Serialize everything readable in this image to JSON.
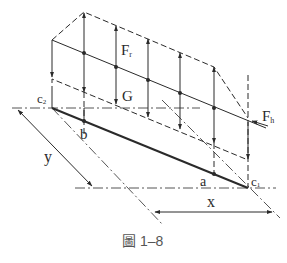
{
  "figure": {
    "caption": "圖 1–8",
    "labels": {
      "Fr": "F",
      "Fr_sub": "r",
      "G": "G",
      "Fh": "F",
      "Fh_sub": "h",
      "c2": "c",
      "c2_sub": "2",
      "c1": "c",
      "c1_sub": "1",
      "a": "a",
      "b": "b",
      "x": "x",
      "y": "y"
    },
    "colors": {
      "line": "#2a2a2a",
      "background": "#ffffff",
      "caption": "#555555"
    }
  }
}
